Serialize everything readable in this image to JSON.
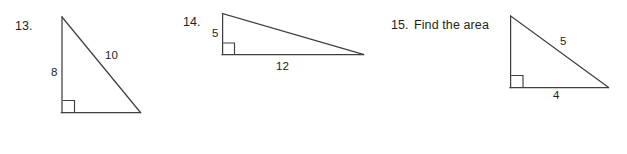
{
  "page": {
    "background_color": "#ffffff",
    "ink_color": "#231f20",
    "line_color": "#3f3f44",
    "width": 627,
    "height": 154
  },
  "problems": [
    {
      "number": "13.",
      "prompt": "",
      "figure": "right-triangle",
      "labels": {
        "leg_vertical": "8",
        "hypotenuse": "10"
      }
    },
    {
      "number": "14.",
      "prompt": "",
      "figure": "right-triangle",
      "labels": {
        "leg_vertical": "5",
        "leg_horizontal": "12"
      }
    },
    {
      "number": "15.",
      "prompt": "Find the area",
      "figure": "right-triangle",
      "labels": {
        "hypotenuse": "5",
        "leg_horizontal": "4"
      }
    }
  ]
}
